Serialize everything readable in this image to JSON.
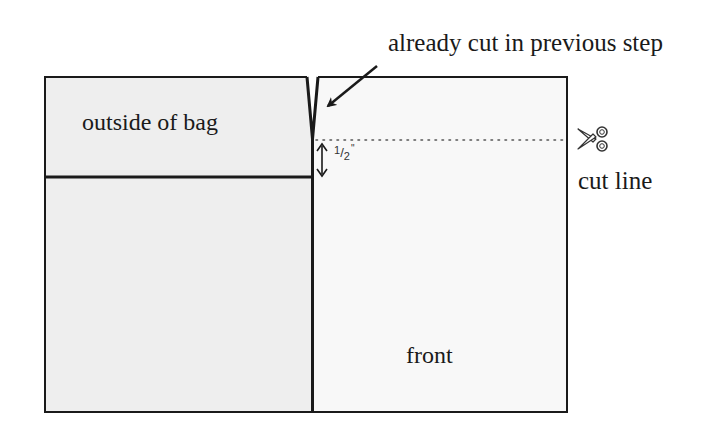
{
  "diagram": {
    "callout": {
      "text": "already cut in previous step"
    },
    "panels": {
      "outside_of_bag": "outside of bag",
      "front": "front"
    },
    "cut_line": {
      "label": "cut line",
      "icon": "scissors-icon"
    },
    "measurement": {
      "numerator": "1",
      "denominator": "2",
      "unit": "\"",
      "full": "1/2\""
    },
    "colors": {
      "stroke": "#1a1a1a",
      "left_panel_fill": "#eeeeee",
      "right_panel_fill": "#f7f7f7",
      "background": "#ffffff",
      "dotted_line": "#555555"
    }
  }
}
